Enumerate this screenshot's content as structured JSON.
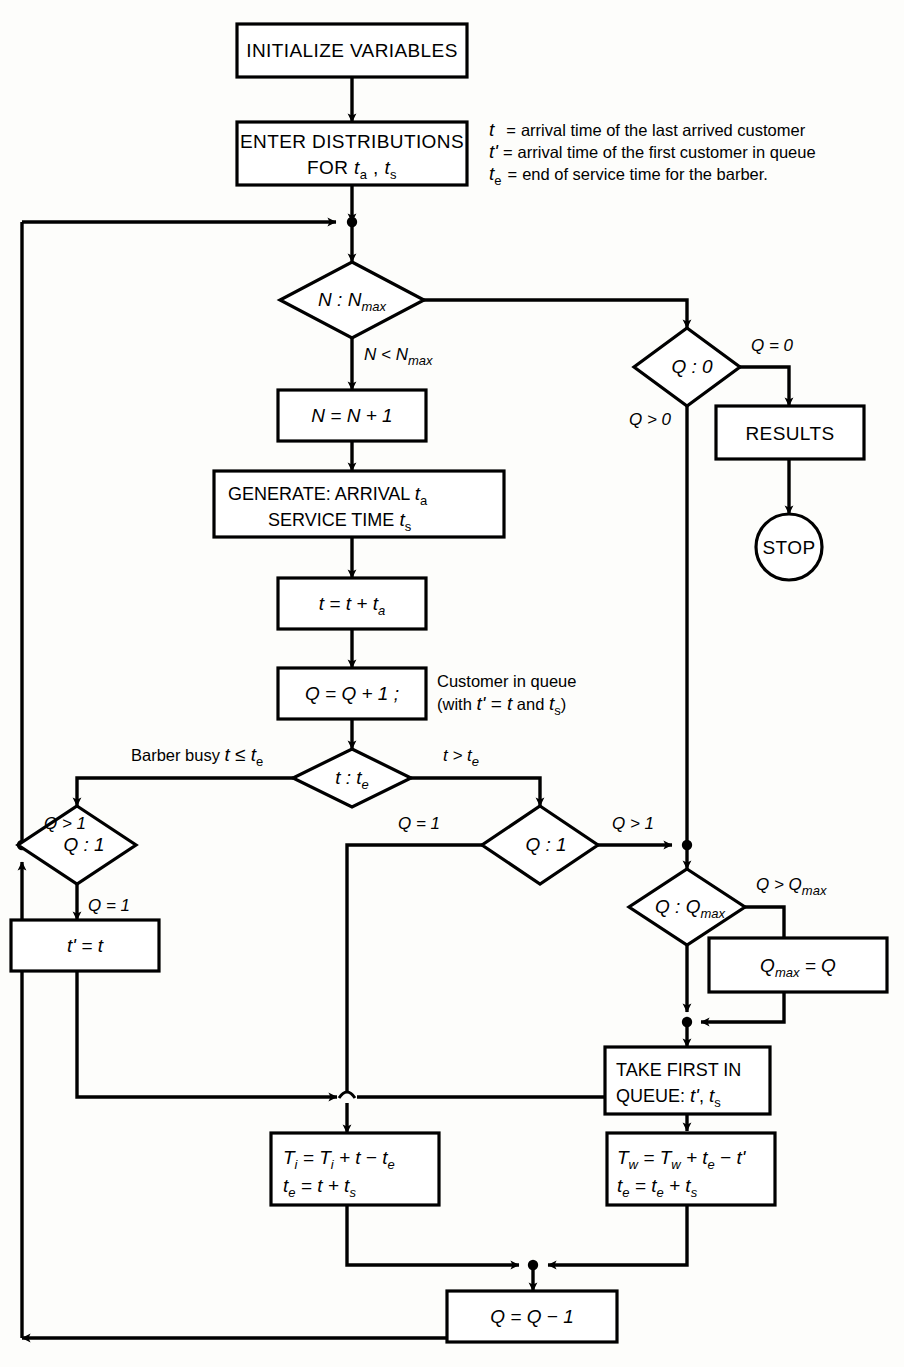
{
  "diagram": {
    "type": "flowchart",
    "background_color": "#fdfdfb",
    "line_color": "#000000"
  },
  "legend": {
    "lines": [
      {
        "sym": "t",
        "sub": "",
        "prime": "",
        "eq": "=",
        "text": "arrival time of the last arrived customer"
      },
      {
        "sym": "t",
        "sub": "",
        "prime": "'",
        "eq": "=",
        "text": "arrival time of the first customer in queue"
      },
      {
        "sym": "t",
        "sub": "e",
        "prime": "",
        "eq": "=",
        "text": "end of service time for the barber."
      }
    ]
  },
  "nodes": {
    "initialize": {
      "label": "INITIALIZE VARIABLES",
      "shape": "process"
    },
    "enter_dist": {
      "line1": "ENTER DISTRIBUTIONS",
      "line2_pre": "FOR ",
      "line2_a": "t",
      "line2_asub": "a",
      "line2_comma": " , ",
      "line2_b": "t",
      "line2_bsub": "s",
      "shape": "process"
    },
    "n_test": {
      "label_pre": "N",
      "label_colon": " : ",
      "label_post": "N",
      "label_sub": "max",
      "shape": "decision"
    },
    "n_inc": {
      "label": "N = N + 1",
      "shape": "process"
    },
    "generate": {
      "line1_pre": "GENERATE: ARRIVAL ",
      "line1_var": "t",
      "line1_sub": "a",
      "line2_pre": "SERVICE TIME ",
      "line2_var": "t",
      "line2_sub": "s",
      "shape": "process"
    },
    "t_update": {
      "pre": "t = t + ",
      "var": "t",
      "sub": "a",
      "shape": "process"
    },
    "q_inc": {
      "label": "Q = Q + 1 ;",
      "shape": "process"
    },
    "t_te_test": {
      "pre": "t",
      "colon": " : ",
      "post": "t",
      "sub": "e",
      "shape": "decision"
    },
    "q1_left": {
      "label_pre": "Q",
      "label_colon": " : ",
      "label_post": "1",
      "shape": "decision"
    },
    "q1_right": {
      "label_pre": "Q",
      "label_colon": " : ",
      "label_post": "1",
      "shape": "decision"
    },
    "tprime_assign": {
      "label": "t' = t",
      "shape": "process"
    },
    "q0_test": {
      "label_pre": "Q",
      "label_colon": " : ",
      "label_post": "0",
      "shape": "decision"
    },
    "results": {
      "label": "RESULTS",
      "shape": "process"
    },
    "stop": {
      "label": "STOP",
      "shape": "terminator"
    },
    "qmax_test": {
      "label_pre": "Q",
      "label_colon": " : ",
      "label_post": "Q",
      "label_sub": "max",
      "shape": "decision"
    },
    "qmax_assign": {
      "pre": "Q",
      "sub": "max",
      "post": " = Q",
      "shape": "process"
    },
    "take_first": {
      "line1": "TAKE FIRST IN",
      "line2_pre": "QUEUE:   ",
      "line2_a": "t'",
      "line2_comma": ", ",
      "line2_b": "t",
      "line2_bsub": "s",
      "shape": "process"
    },
    "idle_update": {
      "l1_a": "T",
      "l1_asub": "i",
      "l1_mid": " = T",
      "l1_bsub": "i",
      "l1_end": " + t − t",
      "l1_esub": "e",
      "l2_a": "t",
      "l2_asub": "e",
      "l2_mid": " = t + t",
      "l2_bsub": "s",
      "shape": "process"
    },
    "wait_update": {
      "l1_a": "T",
      "l1_asub": "w",
      "l1_mid": " = T",
      "l1_bsub": "w",
      "l1_end": " + t",
      "l1_esub": "e",
      "l1_tail": " − t'",
      "l2_a": "t",
      "l2_asub": "e",
      "l2_mid": " = t",
      "l2_bsub": "e",
      "l2_end": " + t",
      "l2_ssub": "s",
      "shape": "process"
    },
    "q_dec": {
      "label": "Q = Q − 1",
      "shape": "process"
    }
  },
  "edge_labels": {
    "n_less_nmax": {
      "pre": "N < N",
      "sub": "max"
    },
    "q_eq_0": "Q = 0",
    "q_gt_0": "Q > 0",
    "barber_busy": {
      "pre": "Barber busy ",
      "var": "t",
      "op": " ≤ t",
      "sub": "e"
    },
    "t_gt_te": {
      "pre": "t > t",
      "sub": "e"
    },
    "q_gt_1_left": "Q > 1",
    "q_eq_1_left": "Q = 1",
    "q_eq_1_right": "Q = 1",
    "q_gt_1_right": "Q > 1",
    "q_gt_qmax": {
      "pre": "Q > Q",
      "sub": "max"
    }
  },
  "annotations": {
    "customer_in_queue": {
      "line1": "Customer in queue",
      "line2_pre": "(with ",
      "line2_a": "t' = t",
      "line2_and": " and ",
      "line2_b": "t",
      "line2_bsub": "s",
      "line2_end": ")"
    }
  }
}
